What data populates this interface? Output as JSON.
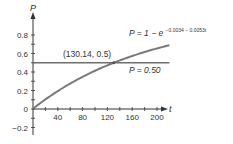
{
  "chart_data": {
    "type": "line",
    "title": "",
    "xlabel": "t",
    "ylabel": "P",
    "xlim": [
      0,
      220
    ],
    "ylim": [
      -0.25,
      0.9
    ],
    "x_ticks": [
      40,
      80,
      120,
      160,
      200
    ],
    "y_ticks": [
      -0.2,
      0,
      0.2,
      0.4,
      0.6,
      0.8
    ],
    "x_tick_labels": [
      "40",
      "80",
      "120",
      "160",
      "200"
    ],
    "y_tick_labels": [
      "−0.2",
      "0",
      "0.2",
      "0.4",
      "0.6",
      "0.8"
    ],
    "grid": false,
    "series": [
      {
        "name": "P = 1 − e^(−0.0034 − 0.0053t)",
        "formula": "1 - exp(-0.0034 - 0.0053*t)",
        "x": [
          0,
          20,
          40,
          60,
          80,
          100,
          120,
          130.14,
          140,
          160,
          180,
          200,
          220
        ],
        "values": [
          0.003,
          0.104,
          0.194,
          0.276,
          0.348,
          0.413,
          0.472,
          0.5,
          0.525,
          0.573,
          0.616,
          0.654,
          0.689
        ]
      },
      {
        "name": "P = 0.50",
        "x": [
          0,
          220
        ],
        "values": [
          0.5,
          0.5
        ]
      }
    ],
    "annotations": [
      {
        "text": "(130.14, 0.5)",
        "x": 130.14,
        "y": 0.5,
        "type": "intersection"
      }
    ]
  },
  "labels": {
    "y_axis": "P",
    "x_axis": "t",
    "intersection": "(130.14, 0.5)",
    "curve_eq_lhs": "P = 1 − e",
    "curve_eq_exp": "−0.0034 − 0.0053t",
    "hline_eq": "P = 0.50"
  },
  "colors": {
    "curve": "#7a7a7a",
    "hline": "#6e6e6e",
    "axis": "#333333",
    "text": "#333333"
  }
}
